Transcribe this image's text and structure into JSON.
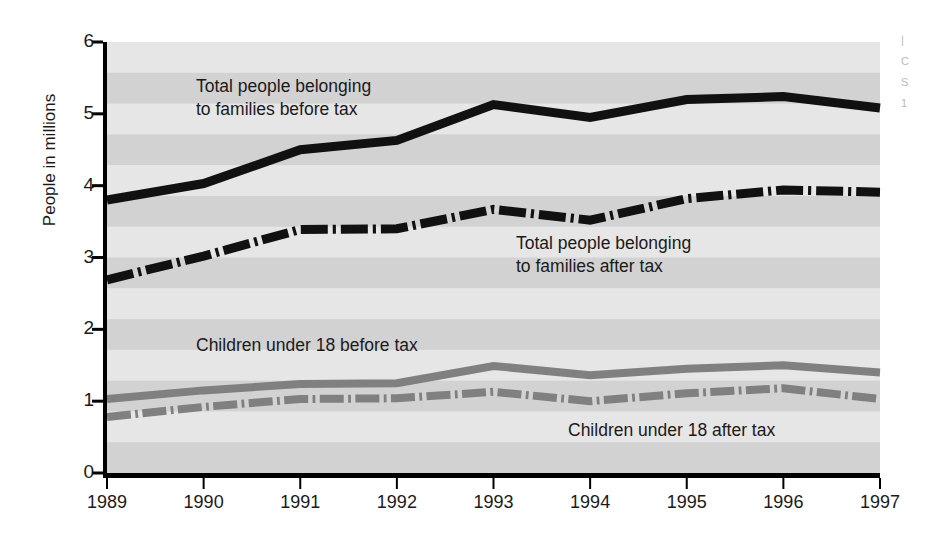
{
  "chart_data": {
    "type": "line",
    "title": "",
    "subtitle": "",
    "xlabel": "",
    "ylabel": "People in millions",
    "categories": [
      1989,
      1990,
      1991,
      1992,
      1993,
      1994,
      1995,
      1996,
      1997
    ],
    "x_tick_labels": [
      "1989",
      "1990",
      "1991",
      "1992",
      "1993",
      "1994",
      "1995",
      "1996",
      "1997"
    ],
    "y_tick_labels": [
      "0",
      "1",
      "2",
      "3",
      "4",
      "5",
      "6"
    ],
    "y_ticks": [
      0,
      1,
      2,
      3,
      4,
      5,
      6
    ],
    "ylim": [
      0,
      6
    ],
    "xlim": [
      1989,
      1997
    ],
    "grid": false,
    "background_bands": true,
    "legend": "inline-annotations",
    "series": [
      {
        "name": "Total people belonging to families before tax",
        "style": "solid",
        "color": "#111111",
        "width": 9,
        "values": [
          3.8,
          4.03,
          4.5,
          4.63,
          5.13,
          4.95,
          5.2,
          5.24,
          5.08
        ]
      },
      {
        "name": "Total people belonging to families after tax",
        "style": "dash-dot",
        "color": "#111111",
        "width": 9,
        "values": [
          2.69,
          3.02,
          3.39,
          3.4,
          3.67,
          3.52,
          3.82,
          3.94,
          3.91
        ]
      },
      {
        "name": "Children under 18 before tax",
        "style": "solid",
        "color": "#808080",
        "width": 8,
        "values": [
          1.03,
          1.15,
          1.24,
          1.25,
          1.49,
          1.36,
          1.45,
          1.5,
          1.4
        ]
      },
      {
        "name": "Children under 18 after tax",
        "style": "dash-dot",
        "color": "#808080",
        "width": 8,
        "values": [
          0.78,
          0.92,
          1.03,
          1.04,
          1.13,
          1.0,
          1.11,
          1.18,
          1.03
        ]
      }
    ],
    "annotations": [
      {
        "id": "note-total-before-tax",
        "text": "Total people belonging\nto families before tax",
        "x_px": 196,
        "y_px": 75
      },
      {
        "id": "note-total-after-tax",
        "text": "Total people belonging\nto families after tax",
        "x_px": 516,
        "y_px": 232
      },
      {
        "id": "note-children-before-tax",
        "text": "Children under 18 before tax",
        "x_px": 196,
        "y_px": 334
      },
      {
        "id": "note-children-after-tax",
        "text": "Children under 18 after tax",
        "x_px": 568,
        "y_px": 419
      }
    ],
    "colors": {
      "total_lines": "#111111",
      "children_lines": "#808080",
      "axis": "#000000",
      "band_light": "#e6e6e6",
      "band_dark": "#d2d2d2",
      "page_background": "#ffffff"
    }
  },
  "edge_note": {
    "lines": [
      "|",
      "C",
      "S",
      "1"
    ]
  }
}
